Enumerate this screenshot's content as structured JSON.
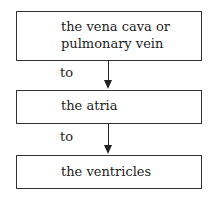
{
  "diagram": {
    "type": "flowchart",
    "nodes": [
      {
        "id": "source",
        "lines": [
          "the vena cava or",
          "pulmonary vein"
        ]
      },
      {
        "id": "atria",
        "label": "the atria"
      },
      {
        "id": "ventricles",
        "label": "the ventricles"
      }
    ],
    "edges": [
      {
        "from": "source",
        "to": "atria",
        "label": "to"
      },
      {
        "from": "atria",
        "to": "ventricles",
        "label": "to"
      }
    ]
  }
}
